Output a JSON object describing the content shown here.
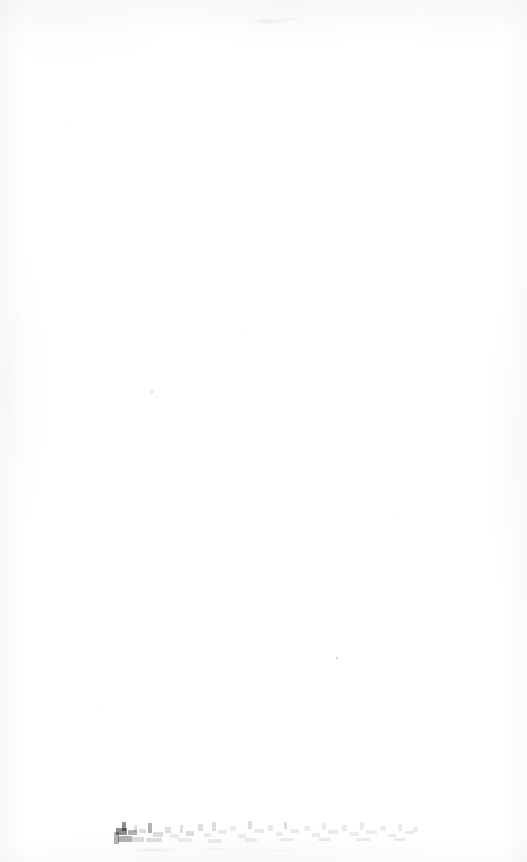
{
  "document": {
    "kind": "scanned-page",
    "page_condition": "blank",
    "background_color": "#ffffff",
    "ink_color": "#000000",
    "width_px": 527,
    "height_px": 862
  },
  "content": {
    "heading": "",
    "body_text": "",
    "page_number": "",
    "notes": ""
  },
  "bottom_line": {
    "legible": false,
    "transcription": "[illegible]",
    "description": "faded degraded text"
  },
  "artifacts": {
    "top_smudge_label": "smudge",
    "speck_label": "speck",
    "grain_label": "paper-grain",
    "edge_label": "scan-edge-shadow",
    "residue_label": "bottom-residue"
  },
  "specks": [
    {
      "x": 151,
      "y": 391,
      "size": 1.6,
      "opacity": 0.2
    },
    {
      "x": 156,
      "y": 396,
      "size": 1.2,
      "opacity": 0.14
    },
    {
      "x": 336,
      "y": 657,
      "size": 1.8,
      "opacity": 0.22
    },
    {
      "x": 246,
      "y": 333,
      "size": 1.1,
      "opacity": 0.1
    },
    {
      "x": 430,
      "y": 38,
      "size": 1.3,
      "opacity": 0.13
    },
    {
      "x": 66,
      "y": 120,
      "size": 1.0,
      "opacity": 0.09
    },
    {
      "x": 398,
      "y": 515,
      "size": 1.0,
      "opacity": 0.08
    },
    {
      "x": 103,
      "y": 710,
      "size": 1.1,
      "opacity": 0.09
    }
  ],
  "ink_marks": [
    {
      "x": 8,
      "y": 12,
      "w": 11,
      "h": 7,
      "tone": "dark"
    },
    {
      "x": 14,
      "y": 6,
      "w": 4,
      "h": 9,
      "tone": "dark"
    },
    {
      "x": 20,
      "y": 14,
      "w": 9,
      "h": 5,
      "tone": "ink"
    },
    {
      "x": 10,
      "y": 20,
      "w": 14,
      "h": 6,
      "tone": "ink"
    },
    {
      "x": 6,
      "y": 16,
      "w": 5,
      "h": 12,
      "tone": "ink"
    },
    {
      "x": 26,
      "y": 9,
      "w": 3,
      "h": 7,
      "tone": "light"
    },
    {
      "x": 31,
      "y": 13,
      "w": 7,
      "h": 4,
      "tone": "light"
    },
    {
      "x": 24,
      "y": 21,
      "w": 12,
      "h": 5,
      "tone": "light"
    },
    {
      "x": 40,
      "y": 7,
      "w": 4,
      "h": 10,
      "tone": "ink"
    },
    {
      "x": 45,
      "y": 16,
      "w": 10,
      "h": 5,
      "tone": "light"
    },
    {
      "x": 38,
      "y": 22,
      "w": 16,
      "h": 4,
      "tone": "light"
    },
    {
      "x": 57,
      "y": 11,
      "w": 6,
      "h": 6,
      "tone": "light"
    },
    {
      "x": 62,
      "y": 18,
      "w": 9,
      "h": 4,
      "tone": "faint"
    },
    {
      "x": 72,
      "y": 9,
      "w": 3,
      "h": 8,
      "tone": "light"
    },
    {
      "x": 78,
      "y": 15,
      "w": 8,
      "h": 5,
      "tone": "light"
    },
    {
      "x": 70,
      "y": 22,
      "w": 14,
      "h": 4,
      "tone": "faint"
    },
    {
      "x": 90,
      "y": 8,
      "w": 5,
      "h": 7,
      "tone": "light"
    },
    {
      "x": 96,
      "y": 17,
      "w": 7,
      "h": 4,
      "tone": "faint"
    },
    {
      "x": 104,
      "y": 6,
      "w": 4,
      "h": 9,
      "tone": "light"
    },
    {
      "x": 110,
      "y": 14,
      "w": 9,
      "h": 4,
      "tone": "faint"
    },
    {
      "x": 100,
      "y": 23,
      "w": 13,
      "h": 4,
      "tone": "faint"
    },
    {
      "x": 122,
      "y": 10,
      "w": 6,
      "h": 5,
      "tone": "faint"
    },
    {
      "x": 130,
      "y": 18,
      "w": 8,
      "h": 4,
      "tone": "faint"
    },
    {
      "x": 140,
      "y": 5,
      "w": 4,
      "h": 8,
      "tone": "light"
    },
    {
      "x": 146,
      "y": 13,
      "w": 10,
      "h": 4,
      "tone": "faint"
    },
    {
      "x": 137,
      "y": 22,
      "w": 12,
      "h": 4,
      "tone": "faint"
    },
    {
      "x": 160,
      "y": 9,
      "w": 5,
      "h": 6,
      "tone": "faint"
    },
    {
      "x": 168,
      "y": 16,
      "w": 7,
      "h": 4,
      "tone": "faint"
    },
    {
      "x": 176,
      "y": 6,
      "w": 3,
      "h": 7,
      "tone": "light"
    },
    {
      "x": 182,
      "y": 13,
      "w": 9,
      "h": 4,
      "tone": "faint"
    },
    {
      "x": 172,
      "y": 22,
      "w": 14,
      "h": 3,
      "tone": "faint"
    },
    {
      "x": 196,
      "y": 10,
      "w": 6,
      "h": 5,
      "tone": "faint"
    },
    {
      "x": 204,
      "y": 17,
      "w": 8,
      "h": 4,
      "tone": "faint"
    },
    {
      "x": 214,
      "y": 7,
      "w": 4,
      "h": 7,
      "tone": "faint"
    },
    {
      "x": 220,
      "y": 14,
      "w": 10,
      "h": 4,
      "tone": "faint"
    },
    {
      "x": 210,
      "y": 22,
      "w": 13,
      "h": 3,
      "tone": "faint"
    },
    {
      "x": 234,
      "y": 9,
      "w": 5,
      "h": 6,
      "tone": "faint"
    },
    {
      "x": 242,
      "y": 16,
      "w": 9,
      "h": 4,
      "tone": "faint"
    },
    {
      "x": 252,
      "y": 6,
      "w": 4,
      "h": 8,
      "tone": "faint"
    },
    {
      "x": 258,
      "y": 14,
      "w": 11,
      "h": 4,
      "tone": "faint"
    },
    {
      "x": 248,
      "y": 22,
      "w": 15,
      "h": 3,
      "tone": "faint"
    },
    {
      "x": 272,
      "y": 10,
      "w": 6,
      "h": 5,
      "tone": "faint"
    },
    {
      "x": 280,
      "y": 18,
      "w": 8,
      "h": 3,
      "tone": "faint"
    },
    {
      "x": 290,
      "y": 8,
      "w": 4,
      "h": 7,
      "tone": "faint"
    },
    {
      "x": 296,
      "y": 15,
      "w": 10,
      "h": 3,
      "tone": "faint"
    },
    {
      "x": 286,
      "y": 22,
      "w": 12,
      "h": 3,
      "tone": "faint"
    },
    {
      "x": 305,
      "y": 11,
      "w": 5,
      "h": 5,
      "tone": "faint"
    }
  ]
}
